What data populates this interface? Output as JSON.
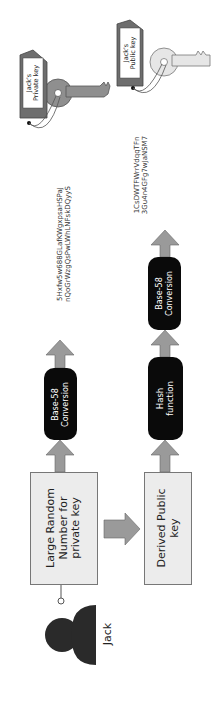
{
  "diagram": {
    "orientation": "rotated-90-ccw",
    "actor": {
      "label": "Jack"
    },
    "nodes": {
      "private_source": {
        "label": "Large Random Number for private key"
      },
      "public_source": {
        "label": "Derived Public key"
      },
      "private_base58": {
        "label_line1": "Base-58",
        "label_line2": "Conversion"
      },
      "hash": {
        "label_line1": "Hash",
        "label_line2": "function"
      },
      "public_base58": {
        "label_line1": "Base-58",
        "label_line2": "Conversion"
      }
    },
    "outputs": {
      "private_key_string": {
        "line1": "5Hxfw5w688GLafKWgxpsaHSPaJ",
        "line2": "nQoGrWzgQsPwLWhLNFskDQyyS"
      },
      "public_key_string": {
        "line1": "1CsDWTFWrrVdqqTFn",
        "line2": "3Gu4n4GFg7wJaNSM7"
      }
    },
    "keys": {
      "private_tag": {
        "line1": "Jack's",
        "line2": "Private key"
      },
      "public_tag": {
        "line1": "Jack's",
        "line2": "Public key"
      }
    },
    "colors": {
      "box_fill": "#ececec",
      "pill_fill": "#0a0a0a",
      "arrow_fill": "#9a9a9a",
      "private_key_fill": "#8f8f8f",
      "public_key_fill": "#e6e6e6",
      "tag_fill": "#6e6e6e"
    }
  }
}
